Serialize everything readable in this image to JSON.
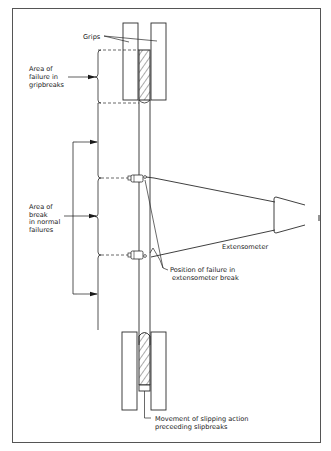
{
  "figure": {
    "type": "tensile test specimen break locations",
    "colors": {
      "line": "#2a2a2a",
      "frame": "#555555",
      "background": "#ffffff"
    }
  },
  "labels": {
    "grips": "Grips",
    "gripbreak": [
      "Area of",
      "failure in",
      "gripbreaks"
    ],
    "normal": [
      "Area of",
      "break",
      "in normal",
      "failures"
    ],
    "extensometer": "Extensometer",
    "ext_break": [
      "Position of failure in",
      "extensometer break"
    ],
    "slip": [
      "Movement of slipping action",
      "preceeding slipbreaks"
    ]
  }
}
